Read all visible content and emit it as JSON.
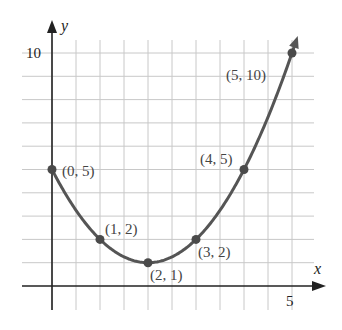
{
  "chart_data": {
    "type": "line",
    "title": "",
    "xlabel": "x",
    "ylabel": "y",
    "xlim": [
      0,
      5
    ],
    "ylim": [
      0,
      10
    ],
    "grid": true,
    "grid_step_x": 0.5,
    "grid_step_y": 1,
    "x_ticks": [
      {
        "value": 5,
        "label": "5"
      }
    ],
    "y_ticks": [
      {
        "value": 10,
        "label": "10"
      }
    ],
    "curve_color": "#555555",
    "points": [
      {
        "x": 0,
        "y": 5,
        "label": "(0, 5)"
      },
      {
        "x": 1,
        "y": 2,
        "label": "(1, 2)"
      },
      {
        "x": 2,
        "y": 1,
        "label": "(2, 1)"
      },
      {
        "x": 3,
        "y": 2,
        "label": "(3, 2)"
      },
      {
        "x": 4,
        "y": 5,
        "label": "(4, 5)"
      },
      {
        "x": 5,
        "y": 10,
        "label": "(5, 10)"
      }
    ],
    "series": [
      {
        "name": "y = x^2 - 4x + 5",
        "x": [
          0,
          1,
          2,
          3,
          4,
          5
        ],
        "values": [
          5,
          2,
          1,
          2,
          5,
          10
        ]
      }
    ]
  }
}
